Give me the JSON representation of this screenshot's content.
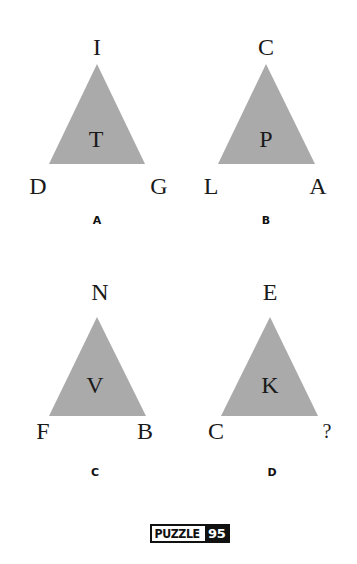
{
  "puzzle": {
    "number": "95",
    "logo_word": "PUZZLE",
    "triangle_color": "#aaaaaa",
    "triangles": [
      {
        "caption": "A",
        "top": "I",
        "center": "T",
        "left": "D",
        "right": "G"
      },
      {
        "caption": "B",
        "top": "C",
        "center": "P",
        "left": "L",
        "right": "A"
      },
      {
        "caption": "C",
        "top": "N",
        "center": "V",
        "left": "F",
        "right": "B"
      },
      {
        "caption": "D",
        "top": "E",
        "center": "K",
        "left": "C",
        "right": "?"
      }
    ]
  }
}
